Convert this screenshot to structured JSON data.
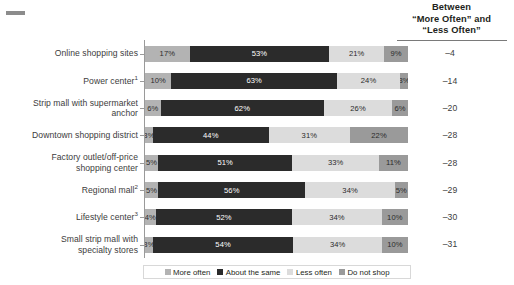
{
  "net_column": {
    "header_line1": "Between",
    "header_line2": "“More Often” and",
    "header_line3": "“Less Often”"
  },
  "legend": {
    "items": [
      {
        "label": "More often",
        "color": "#b3b3b3"
      },
      {
        "label": "About the same",
        "color": "#2b2b2b"
      },
      {
        "label": "Less often",
        "color": "#dcdcdc"
      },
      {
        "label": "Do not shop",
        "color": "#9a9a9a"
      }
    ]
  },
  "rows": [
    {
      "label_line1": "Online shopping sites",
      "label_line2": "",
      "sup": "",
      "values": [
        17,
        53,
        21,
        9
      ],
      "labels": [
        "17%",
        "53%",
        "21%",
        "9%"
      ],
      "net": "–4"
    },
    {
      "label_line1": "Power center",
      "label_line2": "",
      "sup": "1",
      "values": [
        10,
        63,
        24,
        3
      ],
      "labels": [
        "10%",
        "63%",
        "24%",
        "3%"
      ],
      "net": "–14"
    },
    {
      "label_line1": "Strip mall with supermarket",
      "label_line2": "anchor",
      "sup": "",
      "values": [
        6,
        62,
        26,
        6
      ],
      "labels": [
        "6%",
        "62%",
        "26%",
        "6%"
      ],
      "net": "–20"
    },
    {
      "label_line1": "Downtown shopping district",
      "label_line2": "",
      "sup": "",
      "values": [
        3,
        44,
        31,
        22
      ],
      "labels": [
        "3%",
        "44%",
        "31%",
        "22%"
      ],
      "net": "–28"
    },
    {
      "label_line1": "Factory outlet/off-price",
      "label_line2": "shopping center",
      "sup": "",
      "values": [
        5,
        51,
        33,
        11
      ],
      "labels": [
        "5%",
        "51%",
        "33%",
        "11%"
      ],
      "net": "–28"
    },
    {
      "label_line1": "Regional mall",
      "label_line2": "",
      "sup": "2",
      "values": [
        5,
        56,
        34,
        5
      ],
      "labels": [
        "5%",
        "56%",
        "34%",
        "5%"
      ],
      "net": "–29"
    },
    {
      "label_line1": "Lifestyle center",
      "label_line2": "",
      "sup": "3",
      "values": [
        4,
        52,
        34,
        10
      ],
      "labels": [
        "4%",
        "52%",
        "34%",
        "10%"
      ],
      "net": "–30"
    },
    {
      "label_line1": "Small strip mall with",
      "label_line2": "specialty stores",
      "sup": "",
      "values": [
        3,
        54,
        34,
        10
      ],
      "labels": [
        "3%",
        "54%",
        "34%",
        "10%"
      ],
      "net": "–31"
    }
  ],
  "chart_data": {
    "type": "bar",
    "subtype": "stacked-horizontal-100pct",
    "title": "",
    "xlabel": "",
    "ylabel": "",
    "xlim": [
      0,
      100
    ],
    "grid": false,
    "legend_position": "bottom",
    "categories": [
      "Online shopping sites",
      "Power center¹",
      "Strip mall with supermarket anchor",
      "Downtown shopping district",
      "Factory outlet/off-price shopping center",
      "Regional mall²",
      "Lifestyle center³",
      "Small strip mall with specialty stores"
    ],
    "series": [
      {
        "name": "More often",
        "color": "#b3b3b3",
        "values": [
          17,
          10,
          6,
          3,
          5,
          5,
          4,
          3
        ]
      },
      {
        "name": "About the same",
        "color": "#2b2b2b",
        "values": [
          53,
          63,
          62,
          44,
          51,
          56,
          52,
          54
        ]
      },
      {
        "name": "Less often",
        "color": "#dcdcdc",
        "values": [
          21,
          24,
          26,
          31,
          33,
          34,
          34,
          34
        ]
      },
      {
        "name": "Do not shop",
        "color": "#9a9a9a",
        "values": [
          9,
          3,
          6,
          22,
          11,
          5,
          10,
          10
        ]
      }
    ],
    "annotations": {
      "net_column_header": "Between “More Often” and “Less Often”",
      "net_values": [
        -4,
        -14,
        -20,
        -28,
        -28,
        -29,
        -30,
        -31
      ]
    }
  }
}
